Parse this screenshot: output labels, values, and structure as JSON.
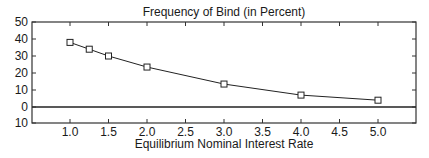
{
  "chart_data": {
    "type": "line",
    "title": "Frequency of Bind (in Percent)",
    "xlabel": "Equilibrium Nominal Interest Rate",
    "ylabel": "",
    "x": [
      1.0,
      1.25,
      1.5,
      2.0,
      3.0,
      4.0,
      5.0
    ],
    "series": [
      {
        "name": "Frequency of Bind",
        "marker": "square",
        "values": [
          38,
          34,
          30,
          23.5,
          13.5,
          7,
          4
        ]
      }
    ],
    "xlim": [
      0.5,
      5.5
    ],
    "ylim": [
      -10,
      50
    ],
    "xticks": [
      1.0,
      1.5,
      2.0,
      2.5,
      3.0,
      3.5,
      4.0,
      4.5,
      5.0
    ],
    "xtick_labels": [
      "1.0",
      "1.5",
      "2.0",
      "2.5",
      "3.0",
      "3.5",
      "4.0",
      "4.5",
      "5.0"
    ],
    "yticks": [
      50,
      40,
      30,
      20,
      10,
      0,
      -10
    ],
    "ytick_labels": [
      "50",
      "40",
      "30",
      "20",
      "10",
      "0",
      "10"
    ],
    "zero_line": true,
    "grid": false,
    "legend": "none"
  }
}
